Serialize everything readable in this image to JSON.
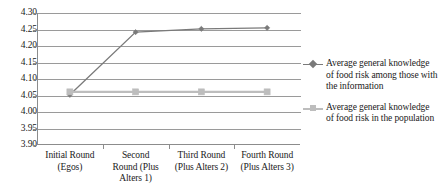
{
  "chart_data": {
    "type": "line",
    "title": "",
    "subtitle": "",
    "xlabel": "",
    "ylabel": "",
    "ylim": [
      3.9,
      4.3
    ],
    "ytick_step": 0.05,
    "grid": "horizontal",
    "legend_position": "right",
    "categories": [
      "Initial Round (Egos)",
      "Second Round (Plus Alters 1)",
      "Third Round (Plus Alters 2)",
      "Fourth Round (Plus Alters 3)"
    ],
    "category_lines": [
      [
        "Initial Round",
        "(Egos)"
      ],
      [
        "Second",
        "Round (Plus",
        "Alters 1)"
      ],
      [
        "Third Round",
        "(Plus Alters 2)"
      ],
      [
        "Fourth Round",
        "(Plus Alters 3)"
      ]
    ],
    "ytick_labels": [
      "4.30",
      "4.25",
      "4.20",
      "4.15",
      "4.10",
      "4.05",
      "4.00",
      "3.95",
      "3.90"
    ],
    "ytick_values": [
      4.3,
      4.25,
      4.2,
      4.15,
      4.1,
      4.05,
      4.0,
      3.95,
      3.9
    ],
    "series": [
      {
        "name": "Average general knowledge of food risk among those with the information",
        "name_lines": [
          "Average general knowledge",
          "of food risk among those with",
          "the information"
        ],
        "values": [
          4.052,
          4.242,
          4.252,
          4.255
        ],
        "color": "#7a7a7a",
        "marker": "diamond"
      },
      {
        "name": "Average general knowledge of food risk in the population",
        "name_lines": [
          "Average general knowledge",
          "of food risk in the population"
        ],
        "values": [
          4.061,
          4.061,
          4.061,
          4.061
        ],
        "color": "#bdbdbd",
        "marker": "square"
      }
    ]
  },
  "colors": {
    "axis": "#8c8c8c",
    "gridline": "#9a9a9a",
    "series_1": "#7a7a7a",
    "series_2": "#bdbdbd",
    "text": "#1a1a1a",
    "background": "#ffffff"
  }
}
